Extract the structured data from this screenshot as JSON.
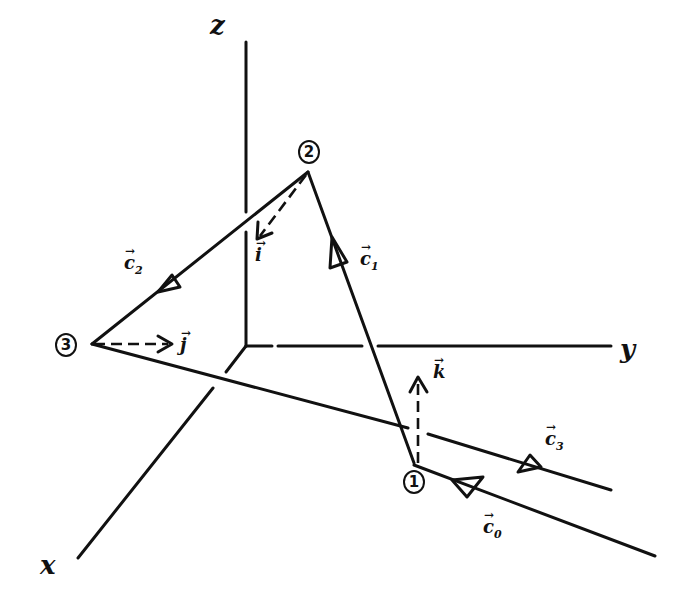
{
  "diagram": {
    "title": "",
    "axes": {
      "z": {
        "label": "z"
      },
      "y": {
        "label": "y"
      },
      "x": {
        "label": "x"
      }
    },
    "points": [
      {
        "id": "p1",
        "label": "1"
      },
      {
        "id": "p2",
        "label": "2"
      },
      {
        "id": "p3",
        "label": "3"
      }
    ],
    "vectors": {
      "c0": {
        "symbol": "c",
        "subscript": "0",
        "arrow": "→"
      },
      "c1": {
        "symbol": "c",
        "subscript": "1",
        "arrow": "→"
      },
      "c2": {
        "symbol": "c",
        "subscript": "2",
        "arrow": "→"
      },
      "c3": {
        "symbol": "c",
        "subscript": "3",
        "arrow": "→"
      },
      "i": {
        "symbol": "i",
        "arrow": "→"
      },
      "j": {
        "symbol": "j",
        "arrow": "→"
      },
      "k": {
        "symbol": "k",
        "arrow": "→"
      }
    },
    "colors": {
      "ink": "#111111",
      "background": "#ffffff"
    }
  }
}
